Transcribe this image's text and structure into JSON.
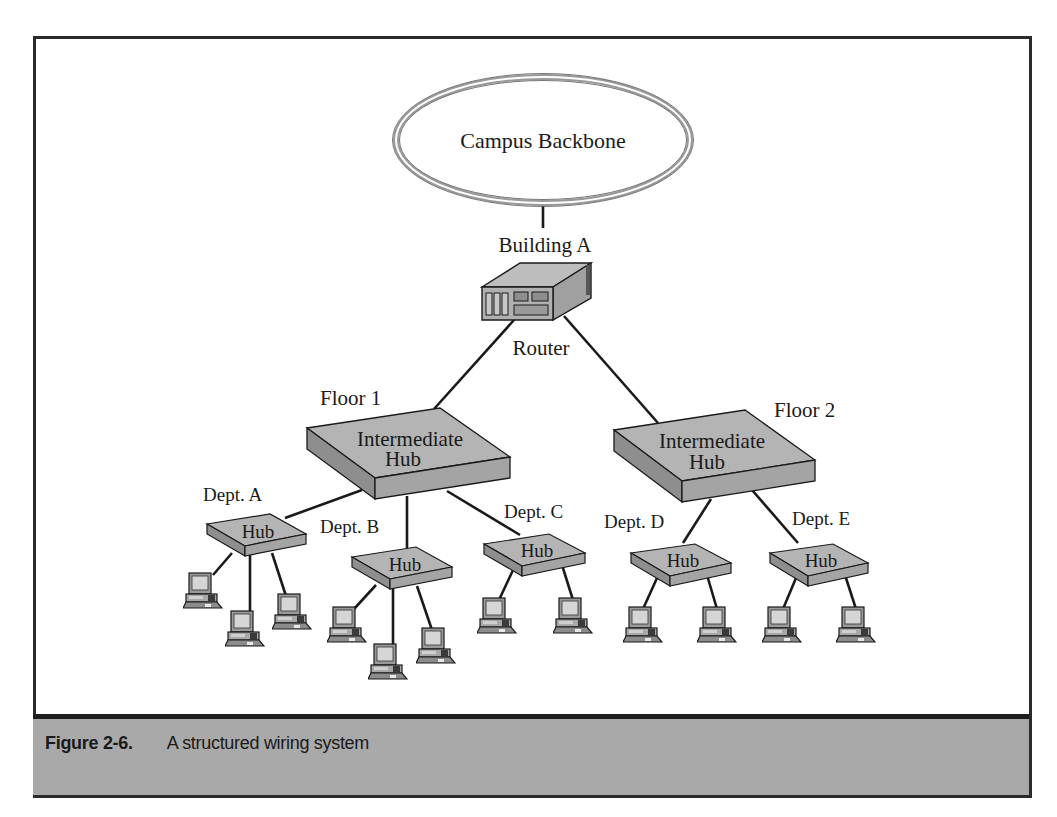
{
  "figure": {
    "number_label": "Figure 2-6.",
    "title": "A structured wiring system"
  },
  "colors": {
    "frame": "#2b2b2b",
    "caption_bg": "#a9a9a9",
    "hub_top": "#b4b4b4",
    "hub_front": "#a2a2a2",
    "hub_side": "#8e8e8e",
    "line": "#1a1a1a"
  },
  "backbone": {
    "label": "Campus Backbone"
  },
  "building": {
    "label": "Building A"
  },
  "router": {
    "label": "Router"
  },
  "floors": [
    {
      "label": "Floor 1",
      "hub_line1": "Intermediate",
      "hub_line2": "Hub",
      "departments": [
        {
          "label": "Dept. A",
          "hub_label": "Hub",
          "computers": 3
        },
        {
          "label": "Dept. B",
          "hub_label": "Hub",
          "computers": 3
        },
        {
          "label": "Dept. C",
          "hub_label": "Hub",
          "computers": 2
        }
      ]
    },
    {
      "label": "Floor 2",
      "hub_line1": "Intermediate",
      "hub_line2": "Hub",
      "departments": [
        {
          "label": "Dept. D",
          "hub_label": "Hub",
          "computers": 2
        },
        {
          "label": "Dept. E",
          "hub_label": "Hub",
          "computers": 2
        }
      ]
    }
  ]
}
